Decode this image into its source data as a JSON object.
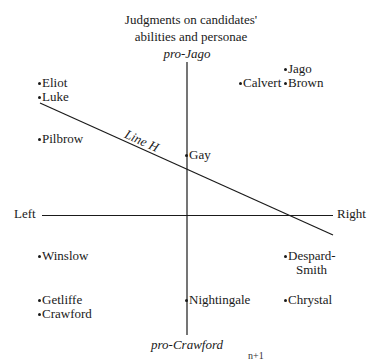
{
  "title": {
    "line1": "Judgments on candidates'",
    "line2": "abilities and personae"
  },
  "axes": {
    "top": "pro-Jago",
    "bottom": "pro-Crawford",
    "left": "Left",
    "right": "Right"
  },
  "line_h": {
    "label": "Line H"
  },
  "candidates": {
    "jago": "Jago",
    "calvert": "Calvert",
    "brown": "Brown",
    "eliot": "Eliot",
    "luke": "Luke",
    "pilbrow": "Pilbrow",
    "gay": "Gay",
    "winslow": "Winslow",
    "despard_smith_1": "Despard-",
    "despard_smith_2": "Smith",
    "getliffe": "Getliffe",
    "crawford": "Crawford",
    "nightingale": "Nightingale",
    "chrystal": "Chrystal"
  },
  "footer": {
    "superscript": "n+1"
  },
  "colors": {
    "ink": "#1a1a1a",
    "background": "#ffffff"
  }
}
